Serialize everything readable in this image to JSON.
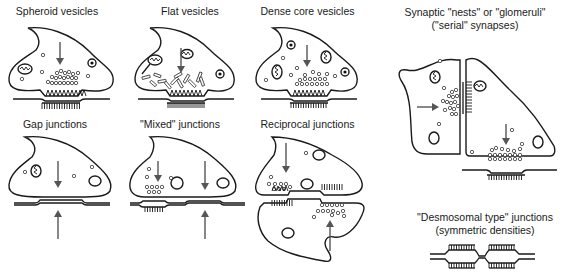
{
  "figure": {
    "panels": [
      {
        "id": "spheroid",
        "label": "Spheroid vesicles"
      },
      {
        "id": "flat",
        "label": "Flat vesicles"
      },
      {
        "id": "dense-core",
        "label": "Dense core vesicles"
      },
      {
        "id": "nests",
        "label_line1": "Synaptic \"nests\" or \"glomeruli\"",
        "label_line2": "(\"serial\" synapses)"
      },
      {
        "id": "gap",
        "label": "Gap junctions"
      },
      {
        "id": "mixed",
        "label": "\"Mixed\" junctions"
      },
      {
        "id": "reciprocal",
        "label": "Reciprocal junctions"
      },
      {
        "id": "desmosomal",
        "label_line1": "\"Desmosomal type\" junctions",
        "label_line2": "(symmetric densities)"
      }
    ],
    "colors": {
      "outline": "#1a1a1a",
      "arrow": "#555555",
      "background": "#ffffff"
    }
  }
}
